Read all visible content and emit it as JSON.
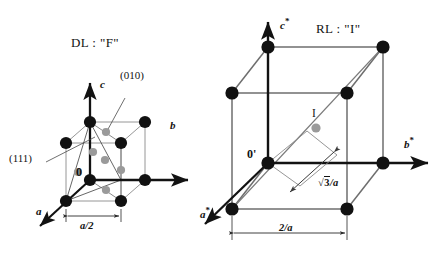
{
  "figure": {
    "width": 443,
    "height": 256,
    "background": "#ffffff",
    "ink": "#121212",
    "edge_gray": "#6e6e6e",
    "atom_black": "#111111",
    "atom_gray": "#9a9a9a"
  },
  "left_panel": {
    "title": "DL : \"F\"",
    "origin_label": "0",
    "axes": [
      {
        "name": "c",
        "label": "c",
        "direction": "up"
      },
      {
        "name": "b",
        "label": "b",
        "direction": "right"
      },
      {
        "name": "a",
        "label": "a",
        "direction": "down-left"
      }
    ],
    "annotations": [
      {
        "name": "plane-111",
        "label": "(111)"
      },
      {
        "name": "plane-010",
        "label": "(010)"
      }
    ],
    "dimension": {
      "label": "a/2",
      "name": "half-a-dimension"
    },
    "lattice_type": "face-centred cubic",
    "corner_atom_count": 8,
    "face_atom_count": 6
  },
  "right_panel": {
    "title": "RL : \"I\"",
    "origin_label": "0'",
    "axes": [
      {
        "name": "c-star",
        "label": "c",
        "star": "*",
        "direction": "up"
      },
      {
        "name": "b-star",
        "label": "b",
        "star": "*",
        "direction": "right"
      },
      {
        "name": "a-star",
        "label": "a",
        "star": "*",
        "direction": "down-left"
      }
    ],
    "centre_site": {
      "label": "I",
      "name": "body-centre-site"
    },
    "dimensions": [
      {
        "name": "edge-dimension",
        "label": "2/a"
      },
      {
        "name": "diagonal-dimension",
        "radical": "3",
        "suffix": "/a"
      }
    ],
    "lattice_type": "body-centred",
    "corner_atom_count": 8,
    "centre_atom_count": 1
  }
}
